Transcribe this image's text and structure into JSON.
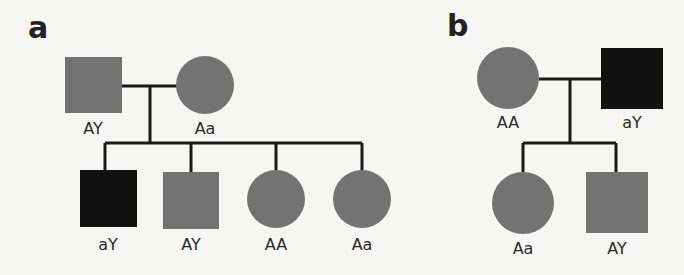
{
  "colors": {
    "unaffected": "#737373",
    "affected": "#111111",
    "line": "#1a1a1a",
    "background": "#f6f6f4"
  },
  "panels": [
    {
      "label": "a",
      "parents": [
        {
          "sex": "male",
          "genotype": "AY",
          "affected": false
        },
        {
          "sex": "female",
          "genotype": "Aa",
          "affected": false
        }
      ],
      "children": [
        {
          "sex": "male",
          "genotype": "aY",
          "affected": true
        },
        {
          "sex": "male",
          "genotype": "AY",
          "affected": false
        },
        {
          "sex": "female",
          "genotype": "AA",
          "affected": false
        },
        {
          "sex": "female",
          "genotype": "Aa",
          "affected": false
        }
      ]
    },
    {
      "label": "b",
      "parents": [
        {
          "sex": "female",
          "genotype": "AA",
          "affected": false
        },
        {
          "sex": "male",
          "genotype": "aY",
          "affected": true
        }
      ],
      "children": [
        {
          "sex": "female",
          "genotype": "Aa",
          "affected": false
        },
        {
          "sex": "male",
          "genotype": "AY",
          "affected": false
        }
      ]
    }
  ]
}
